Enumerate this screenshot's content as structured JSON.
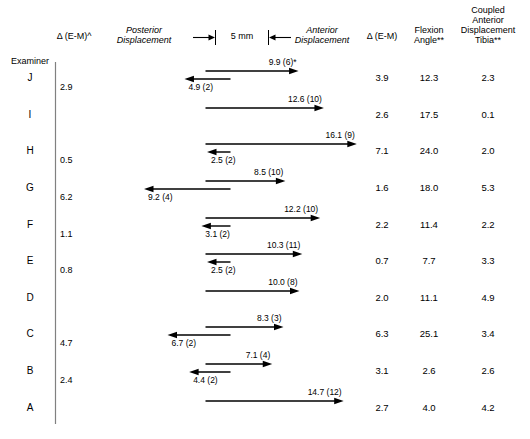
{
  "figure": {
    "type": "arrow-chart",
    "scale": {
      "label": "5 mm",
      "millimeters": 5,
      "pixels_per_mm": 9.4
    },
    "axis_labels": {
      "left_italic_1": "Posterior",
      "left_italic_2": "Displacement",
      "right_italic_1": "Anterior",
      "right_italic_2": "Displacement"
    },
    "headers": {
      "examiner": "Examiner",
      "delta_left": "Δ (E-M)^",
      "delta_right": "Δ (E-M)",
      "flexion_1": "Flexion",
      "flexion_2": "Angle**",
      "coupled_1": "Coupled",
      "coupled_2": "Anterior",
      "coupled_3": "Displacement",
      "coupled_4": "Tibia**"
    },
    "rows": [
      {
        "examiner": "J",
        "delta_left": "2.9",
        "anterior": {
          "value": 9.9,
          "n": 6,
          "label": "9.9 (6)*"
        },
        "posterior": {
          "value": 4.9,
          "n": 2,
          "label": "4.9 (2)"
        },
        "delta_right": "3.9",
        "flexion_angle": "12.3",
        "coupled_displacement": "2.3"
      },
      {
        "examiner": "I",
        "delta_left": "",
        "anterior": {
          "value": 12.6,
          "n": 10,
          "label": "12.6 (10)"
        },
        "posterior": null,
        "delta_right": "2.6",
        "flexion_angle": "17.5",
        "coupled_displacement": "0.1"
      },
      {
        "examiner": "H",
        "delta_left": "0.5",
        "anterior": {
          "value": 16.1,
          "n": 9,
          "label": "16.1 (9)"
        },
        "posterior": {
          "value": 2.5,
          "n": 2,
          "label": "2.5 (2)"
        },
        "delta_right": "7.1",
        "flexion_angle": "24.0",
        "coupled_displacement": "2.0"
      },
      {
        "examiner": "G",
        "delta_left": "6.2",
        "anterior": {
          "value": 8.5,
          "n": 10,
          "label": "8.5 (10)"
        },
        "posterior": {
          "value": 9.2,
          "n": 4,
          "label": "9.2 (4)"
        },
        "delta_right": "1.6",
        "flexion_angle": "18.0",
        "coupled_displacement": "5.3"
      },
      {
        "examiner": "F",
        "delta_left": "1.1",
        "anterior": {
          "value": 12.2,
          "n": 10,
          "label": "12.2 (10)"
        },
        "posterior": {
          "value": 3.1,
          "n": 2,
          "label": "3.1 (2)"
        },
        "delta_right": "2.2",
        "flexion_angle": "11.4",
        "coupled_displacement": "2.2"
      },
      {
        "examiner": "E",
        "delta_left": "0.8",
        "anterior": {
          "value": 10.3,
          "n": 11,
          "label": "10.3 (11)"
        },
        "posterior": {
          "value": 2.5,
          "n": 2,
          "label": "2.5 (2)"
        },
        "delta_right": "0.7",
        "flexion_angle": "7.7",
        "coupled_displacement": "3.3"
      },
      {
        "examiner": "D",
        "delta_left": "",
        "anterior": {
          "value": 10.0,
          "n": 8,
          "label": "10.0 (8)"
        },
        "posterior": null,
        "delta_right": "2.0",
        "flexion_angle": "11.1",
        "coupled_displacement": "4.9"
      },
      {
        "examiner": "C",
        "delta_left": "4.7",
        "anterior": {
          "value": 8.3,
          "n": 3,
          "label": "8.3 (3)"
        },
        "posterior": {
          "value": 6.7,
          "n": 2,
          "label": "6.7 (2)"
        },
        "delta_right": "6.3",
        "flexion_angle": "25.1",
        "coupled_displacement": "3.4"
      },
      {
        "examiner": "B",
        "delta_left": "2.4",
        "anterior": {
          "value": 7.1,
          "n": 4,
          "label": "7.1 (4)"
        },
        "posterior": {
          "value": 4.4,
          "n": 2,
          "label": "4.4 (2)"
        },
        "delta_right": "3.1",
        "flexion_angle": "2.6",
        "coupled_displacement": "2.6"
      },
      {
        "examiner": "A",
        "delta_left": "",
        "anterior": {
          "value": 14.7,
          "n": 12,
          "label": "14.7 (12)"
        },
        "posterior": null,
        "delta_right": "2.7",
        "flexion_angle": "4.0",
        "coupled_displacement": "4.2"
      }
    ]
  },
  "chart_data": {
    "type": "bar",
    "title": "",
    "xlabel": "Displacement (mm)",
    "ylabel": "Examiner",
    "categories": [
      "J",
      "I",
      "H",
      "G",
      "F",
      "E",
      "D",
      "C",
      "B",
      "A"
    ],
    "series": [
      {
        "name": "Anterior Displacement (mm)",
        "values": [
          9.9,
          12.6,
          16.1,
          8.5,
          12.2,
          10.3,
          10.0,
          8.3,
          7.1,
          14.7
        ]
      },
      {
        "name": "Posterior Displacement (mm)",
        "values": [
          4.9,
          null,
          2.5,
          9.2,
          3.1,
          2.5,
          null,
          6.7,
          4.4,
          null
        ]
      },
      {
        "name": "Anterior n",
        "values": [
          6,
          10,
          9,
          10,
          10,
          11,
          8,
          3,
          4,
          12
        ]
      },
      {
        "name": "Posterior n",
        "values": [
          2,
          null,
          2,
          4,
          2,
          2,
          null,
          2,
          2,
          null
        ]
      },
      {
        "name": "Δ (E-M)^",
        "values": [
          2.9,
          null,
          0.5,
          6.2,
          1.1,
          0.8,
          null,
          4.7,
          2.4,
          null
        ]
      },
      {
        "name": "Δ (E-M)",
        "values": [
          3.9,
          2.6,
          7.1,
          1.6,
          2.2,
          0.7,
          2.0,
          6.3,
          3.1,
          2.7
        ]
      },
      {
        "name": "Flexion Angle**",
        "values": [
          12.3,
          17.5,
          24.0,
          18.0,
          11.4,
          7.7,
          11.1,
          25.1,
          2.6,
          4.0
        ]
      },
      {
        "name": "Coupled Anterior Displacement Tibia**",
        "values": [
          2.3,
          0.1,
          2.0,
          5.3,
          2.2,
          3.3,
          4.9,
          3.4,
          2.6,
          4.2
        ]
      }
    ],
    "grid": false,
    "legend": "none"
  }
}
